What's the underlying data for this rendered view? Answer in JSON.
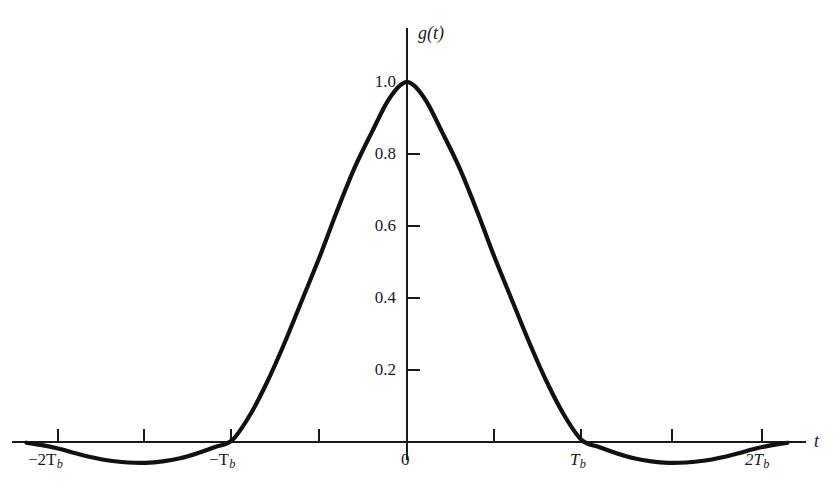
{
  "chart_data": {
    "type": "line",
    "title": "",
    "subtitle": "",
    "xlabel": "t",
    "ylabel": "g(t)",
    "xlim": [
      -2.25,
      2.18
    ],
    "ylim": [
      -0.11,
      1.06
    ],
    "grid": false,
    "legend": null,
    "x_unit": "Tb",
    "x_tick_labels": [
      "-2Tb",
      "",
      "-Tb",
      "",
      "0",
      "",
      "Tb",
      "",
      "2Tb"
    ],
    "x_ticks": [
      -2,
      -1.5,
      -1,
      -0.5,
      0,
      0.5,
      1,
      1.5,
      2
    ],
    "x_labeled_ticks": [
      -2,
      -1,
      0,
      1,
      2
    ],
    "y_ticks": [
      0.2,
      0.4,
      0.6,
      0.8,
      1.0
    ],
    "y_tick_labels": [
      "0.2",
      "0.4",
      "0.6",
      "0.8",
      "1.0"
    ],
    "series": [
      {
        "name": "g(t)",
        "color": "#111111",
        "x": [
          -2.18,
          -2.1,
          -2.0,
          -1.9,
          -1.8,
          -1.7,
          -1.6,
          -1.5,
          -1.4,
          -1.3,
          -1.2,
          -1.1,
          -1.0,
          -0.9,
          -0.8,
          -0.7,
          -0.6,
          -0.5,
          -0.4,
          -0.3,
          -0.2,
          -0.1,
          0.0,
          0.1,
          0.2,
          0.3,
          0.4,
          0.5,
          0.6,
          0.7,
          0.8,
          0.9,
          1.0,
          1.1,
          1.2,
          1.3,
          1.4,
          1.5,
          1.6,
          1.7,
          1.8,
          1.9,
          2.0,
          2.1,
          2.18
        ],
        "y": [
          -0.002,
          -0.008,
          -0.018,
          -0.031,
          -0.043,
          -0.052,
          -0.057,
          -0.058,
          -0.054,
          -0.045,
          -0.031,
          -0.014,
          0.006,
          0.075,
          0.168,
          0.277,
          0.396,
          0.515,
          0.643,
          0.762,
          0.862,
          0.955,
          1.0,
          0.955,
          0.862,
          0.762,
          0.643,
          0.515,
          0.396,
          0.277,
          0.168,
          0.075,
          0.006,
          -0.014,
          -0.031,
          -0.045,
          -0.054,
          -0.058,
          -0.057,
          -0.052,
          -0.043,
          -0.031,
          -0.018,
          -0.008,
          -0.002
        ]
      }
    ],
    "annotations": []
  },
  "axis_labels": {
    "y_axis_name": "g(t)",
    "x_axis_name": "t"
  },
  "x_tick_text": {
    "minus2Tb": "−2T",
    "minus2Tb_sub": "b",
    "minusTb": "−T",
    "minusTb_sub": "b",
    "zero": "0",
    "Tb": "T",
    "Tb_sub": "b",
    "twoTb": "2T",
    "twoTb_sub": "b"
  },
  "y_tick_text": {
    "t02": "0.2",
    "t04": "0.4",
    "t06": "0.6",
    "t08": "0.8",
    "t10": "1.0"
  },
  "colors": {
    "background": "#ffffff",
    "curve": "#111111",
    "axis": "#1a1a1a",
    "text": "#1a1a1a"
  }
}
